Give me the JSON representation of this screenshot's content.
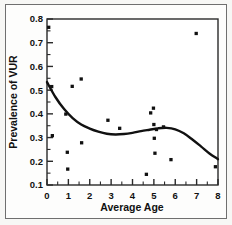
{
  "chart_data": {
    "type": "scatter",
    "title": "",
    "xlabel": "Average Age",
    "ylabel": "Prevalence of VUR",
    "xlim": [
      0,
      8
    ],
    "ylim": [
      0.1,
      0.8
    ],
    "xticks": [
      0,
      1,
      2,
      3,
      4,
      5,
      6,
      7,
      8
    ],
    "xtick_labels": [
      "0",
      "1",
      "2",
      "3",
      "4",
      "5",
      "6",
      "7",
      "8"
    ],
    "yticks": [
      0.1,
      0.2,
      0.3,
      0.4,
      0.5,
      0.6,
      0.7,
      0.8
    ],
    "ytick_labels": [
      "0.1",
      "0.2",
      "0.3",
      "0.4",
      "0.5",
      "0.6",
      "0.7",
      "0.8"
    ],
    "grid": false,
    "legend": "none",
    "marker": "square",
    "marker_color": "#111111",
    "line_color": "#111111",
    "series": [
      {
        "name": "Studies",
        "type": "scatter",
        "points": [
          [
            0.08,
            0.765
          ],
          [
            0.22,
            0.515
          ],
          [
            0.25,
            0.308
          ],
          [
            0.88,
            0.399
          ],
          [
            0.95,
            0.238
          ],
          [
            0.97,
            0.167
          ],
          [
            1.18,
            0.516
          ],
          [
            1.6,
            0.547
          ],
          [
            1.62,
            0.278
          ],
          [
            2.85,
            0.373
          ],
          [
            3.4,
            0.339
          ],
          [
            4.65,
            0.145
          ],
          [
            4.85,
            0.404
          ],
          [
            4.98,
            0.424
          ],
          [
            5.0,
            0.355
          ],
          [
            5.02,
            0.297
          ],
          [
            5.05,
            0.234
          ],
          [
            5.12,
            0.334
          ],
          [
            5.45,
            0.345
          ],
          [
            5.8,
            0.207
          ],
          [
            6.98,
            0.739
          ],
          [
            7.88,
            0.177
          ]
        ]
      },
      {
        "name": "Smoothed fit",
        "type": "line",
        "points": [
          [
            0.0,
            0.534
          ],
          [
            0.4,
            0.47
          ],
          [
            0.8,
            0.42
          ],
          [
            1.2,
            0.382
          ],
          [
            1.6,
            0.355
          ],
          [
            2.0,
            0.338
          ],
          [
            2.4,
            0.325
          ],
          [
            2.8,
            0.316
          ],
          [
            3.2,
            0.313
          ],
          [
            3.6,
            0.315
          ],
          [
            4.0,
            0.32
          ],
          [
            4.4,
            0.327
          ],
          [
            4.8,
            0.333
          ],
          [
            5.2,
            0.339
          ],
          [
            5.6,
            0.341
          ],
          [
            6.0,
            0.335
          ],
          [
            6.4,
            0.318
          ],
          [
            6.8,
            0.292
          ],
          [
            7.2,
            0.263
          ],
          [
            7.6,
            0.233
          ],
          [
            8.0,
            0.209
          ]
        ]
      }
    ]
  }
}
